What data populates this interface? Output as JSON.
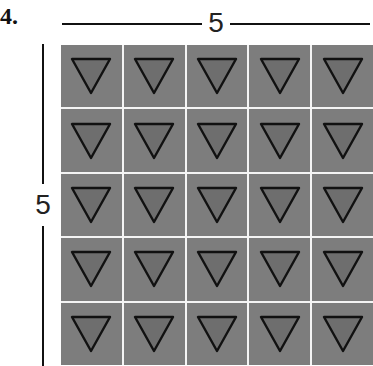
{
  "problem": {
    "number": "4."
  },
  "dimensions": {
    "top_label": "5",
    "left_label": "5"
  },
  "grid": {
    "rows": 5,
    "columns": 5,
    "cell_icon": "down-triangle-icon",
    "colors": {
      "cell": "#7d7d7d",
      "triangle_fill": "#6e6e6e",
      "triangle_stroke": "#111111",
      "gridline": "#f4f4f4"
    }
  }
}
